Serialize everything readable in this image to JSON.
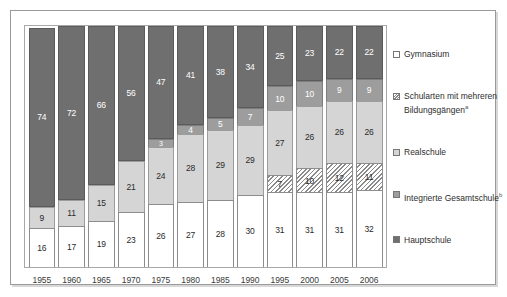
{
  "chart_data": {
    "type": "bar",
    "subtype": "stacked-100-percent",
    "title": "",
    "xlabel": "",
    "ylabel": "",
    "ylim": [
      0,
      100
    ],
    "grid": false,
    "legend_position": "right",
    "categories": [
      "1955",
      "1960",
      "1965",
      "1970",
      "1975",
      "1980",
      "1985",
      "1990",
      "1995",
      "2000",
      "2005",
      "2006"
    ],
    "stack_order_bottom_to_top": [
      "Hauptschule",
      "Integrierte Gesamtschule",
      "Realschule",
      "Schularten mit mehreren Bildungsgängen",
      "Gymnasium"
    ],
    "series": [
      {
        "name": "Hauptschule",
        "color": "#706f6f",
        "pattern": "solid",
        "values": [
          74,
          72,
          66,
          56,
          47,
          41,
          38,
          34,
          25,
          23,
          22,
          22
        ],
        "labels": [
          "74",
          "72",
          "66",
          "56",
          "47",
          "41",
          "38",
          "34",
          "25",
          "23",
          "22",
          "22"
        ]
      },
      {
        "name": "Integrierte Gesamtschule",
        "color": "#9d9d9d",
        "pattern": "solid",
        "values": [
          0,
          0,
          0,
          0,
          3,
          4,
          5,
          7,
          10,
          10,
          9,
          9
        ],
        "labels": [
          "",
          "",
          "",
          "",
          "3",
          "4",
          "5",
          "7",
          "10",
          "10",
          "9",
          "9"
        ]
      },
      {
        "name": "Realschule",
        "color": "#d5d5d5",
        "pattern": "solid",
        "values": [
          9,
          11,
          15,
          21,
          24,
          28,
          29,
          29,
          27,
          26,
          26,
          26
        ],
        "labels": [
          "9",
          "11",
          "15",
          "21",
          "24",
          "28",
          "29",
          "29",
          "27",
          "26",
          "26",
          "26"
        ]
      },
      {
        "name": "Schularten mit mehreren Bildungsgängen",
        "color": "#ffffff",
        "pattern": "diagonal-hatch",
        "values": [
          0,
          0,
          0,
          0,
          0,
          0,
          0,
          0,
          7,
          10,
          12,
          11
        ],
        "labels": [
          "",
          "",
          "",
          "",
          "",
          "",
          "",
          "",
          "7",
          "10",
          "12",
          "11"
        ]
      },
      {
        "name": "Gymnasium",
        "color": "#ffffff",
        "pattern": "solid",
        "values": [
          16,
          17,
          19,
          23,
          26,
          27,
          28,
          30,
          31,
          31,
          31,
          32
        ],
        "labels": [
          "16",
          "17",
          "19",
          "23",
          "26",
          "27",
          "28",
          "30",
          "31",
          "31",
          "31",
          "32"
        ]
      }
    ]
  },
  "legend": {
    "items": [
      {
        "label": "Gymnasium",
        "note": "",
        "swatch": "gymnasium"
      },
      {
        "label": "Schularten mit mehreren Bildungsgängen",
        "note": "a",
        "swatch": "mehrere"
      },
      {
        "label": "Realschule",
        "note": "",
        "swatch": "realschule"
      },
      {
        "label": "Integrierte Gesamtschule",
        "note": "b",
        "swatch": "igs"
      },
      {
        "label": "Hauptschule",
        "note": "",
        "swatch": "hauptschule"
      }
    ]
  }
}
